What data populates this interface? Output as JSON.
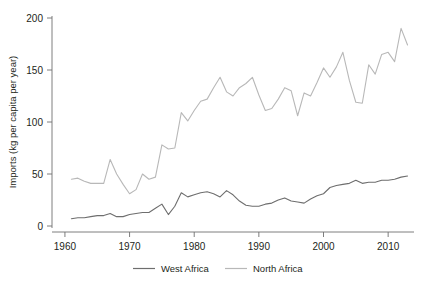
{
  "chart_data": {
    "type": "line",
    "title": "",
    "subtitle": "",
    "xlabel": "",
    "ylabel": "Imports (kg per capita per year)",
    "xlim": [
      1958,
      2014
    ],
    "ylim": [
      0,
      200
    ],
    "xticks": [
      1960,
      1970,
      1980,
      1990,
      2000,
      2010
    ],
    "xtick_labels": [
      "1960",
      "1970",
      "1980",
      "1990",
      "2000",
      "2010"
    ],
    "yticks": [
      0,
      50,
      100,
      150,
      200
    ],
    "ytick_labels": [
      "0",
      "50",
      "100",
      "150",
      "200"
    ],
    "grid": false,
    "legend_position": "bottom",
    "x": [
      1961,
      1962,
      1963,
      1964,
      1965,
      1966,
      1967,
      1968,
      1969,
      1970,
      1971,
      1972,
      1973,
      1974,
      1975,
      1976,
      1977,
      1978,
      1979,
      1980,
      1981,
      1982,
      1983,
      1984,
      1985,
      1986,
      1987,
      1988,
      1989,
      1990,
      1991,
      1992,
      1993,
      1994,
      1995,
      1996,
      1997,
      1998,
      1999,
      2000,
      2001,
      2002,
      2003,
      2004,
      2005,
      2006,
      2007,
      2008,
      2009,
      2010,
      2011,
      2012,
      2013
    ],
    "series": [
      {
        "name": "West Africa",
        "color": "#6e6e6e",
        "values": [
          7,
          8,
          8,
          9,
          10,
          10,
          12,
          9,
          9,
          11,
          12,
          13,
          13,
          17,
          21,
          11,
          19,
          32,
          28,
          30,
          32,
          33,
          31,
          28,
          34,
          30,
          24,
          20,
          19,
          19,
          21,
          22,
          25,
          27,
          24,
          23,
          22,
          26,
          29,
          31,
          37,
          39,
          40,
          41,
          44,
          41,
          42,
          42,
          44,
          44,
          45,
          47,
          48
        ]
      },
      {
        "name": "North Africa",
        "color": "#b8b8b8",
        "values": [
          45,
          46,
          43,
          41,
          41,
          41,
          64,
          50,
          40,
          31,
          35,
          50,
          45,
          47,
          78,
          74,
          75,
          109,
          101,
          111,
          120,
          122,
          133,
          143,
          129,
          125,
          133,
          137,
          143,
          126,
          111,
          113,
          122,
          133,
          130,
          106,
          128,
          125,
          138,
          152,
          143,
          153,
          167,
          140,
          119,
          118,
          155,
          146,
          165,
          167,
          158,
          190,
          174
        ]
      }
    ]
  },
  "legend": {
    "items": [
      {
        "label": "West Africa",
        "color": "#6e6e6e"
      },
      {
        "label": "North Africa",
        "color": "#b8b8b8"
      }
    ]
  }
}
